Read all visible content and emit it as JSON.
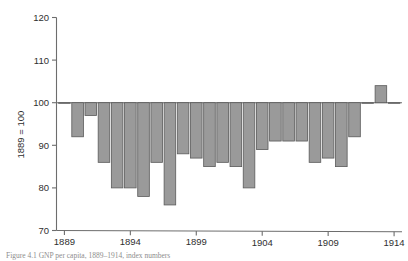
{
  "figure": {
    "caption": "Figure 4.1  GNP per capita, 1889–1914, index numbers"
  },
  "chart_data": {
    "type": "bar",
    "title": "",
    "subtitle": "",
    "xlabel": "",
    "ylabel": "1889 = 100",
    "ylim": [
      70,
      120
    ],
    "xlim": [
      1888.4,
      1914.6
    ],
    "grid": false,
    "legend": null,
    "baseline": 100,
    "ytick_labels": [
      "70",
      "80",
      "90",
      "100",
      "110",
      "120"
    ],
    "yticks": [
      70,
      80,
      90,
      100,
      110,
      120
    ],
    "xtick_labels": [
      "1889",
      "1894",
      "1899",
      "1904",
      "1909",
      "1914"
    ],
    "xticks": [
      1889,
      1894,
      1899,
      1904,
      1909,
      1914
    ],
    "categories": [
      "1889",
      "1890",
      "1891",
      "1892",
      "1893",
      "1894",
      "1895",
      "1896",
      "1897",
      "1898",
      "1899",
      "1900",
      "1901",
      "1902",
      "1903",
      "1904",
      "1905",
      "1906",
      "1907",
      "1908",
      "1909",
      "1910",
      "1911",
      "1912",
      "1913",
      "1914"
    ],
    "values": [
      100,
      92,
      97,
      86,
      80,
      80,
      78,
      86,
      76,
      88,
      87,
      85,
      86,
      85,
      80,
      89,
      91,
      91,
      91,
      86,
      87,
      85,
      92,
      100,
      104,
      100
    ],
    "bar_color": "#9a9a9a",
    "bar_edge_color": "#5a5a5a",
    "axis_color": "#6d6d6d"
  }
}
